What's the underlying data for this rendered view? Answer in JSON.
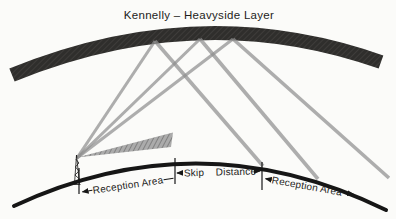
{
  "title": "Kennelly – Heavyside Layer",
  "labels": {
    "reception_area_left": "Reception Area",
    "skip": "Skip",
    "distance": "Distance",
    "reception_area_right": "Reception Area"
  },
  "icons": {
    "transmitter_tower": "antenna-tower-icon"
  },
  "colors": {
    "background": "#fbfbf9",
    "ionosphere_band": "#2f2e2c",
    "ionosphere_hatch": "#4a4845",
    "ray": "#8f8f8f",
    "ground_wave_light": "#ababab",
    "ground_wave_dark": "#6f6f6f",
    "ink": "#161616",
    "text": "#1d1d1b"
  }
}
